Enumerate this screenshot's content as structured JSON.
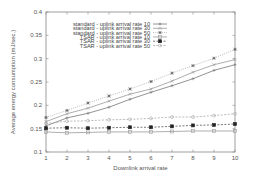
{
  "chart_data": {
    "type": "line",
    "title": "",
    "xlabel": "Downlink arrival rate",
    "ylabel": "Average energy consumption (mJ/sec.)",
    "x": [
      1,
      2,
      3,
      4,
      5,
      6,
      7,
      8,
      9,
      10
    ],
    "xlim": [
      1,
      10
    ],
    "ylim": [
      0.1,
      0.4
    ],
    "xticks": [
      "1",
      "2",
      "3",
      "4",
      "5",
      "6",
      "7",
      "8",
      "9",
      "10"
    ],
    "yticks": [
      "0.1",
      "0.15",
      "0.2",
      "0.25",
      "0.3",
      "0.35",
      "0.4"
    ],
    "grid": false,
    "legend_position": "upper-left-inside",
    "series": [
      {
        "name": "standard - uplink arrival rate 10",
        "marker": "plus",
        "dash": "solid",
        "color": "#777777",
        "values": [
          0.156,
          0.173,
          0.183,
          0.196,
          0.213,
          0.228,
          0.242,
          0.257,
          0.275,
          0.287
        ]
      },
      {
        "name": "standard - uplink arrival rate 30",
        "marker": "cross",
        "dash": "solid",
        "color": "#999999",
        "values": [
          0.165,
          0.182,
          0.194,
          0.209,
          0.224,
          0.235,
          0.252,
          0.271,
          0.287,
          0.298
        ]
      },
      {
        "name": "standard - uplink arrival rate 50",
        "marker": "asterisk",
        "dash": "dotted",
        "color": "#aaaaaa",
        "values": [
          0.174,
          0.189,
          0.205,
          0.22,
          0.235,
          0.251,
          0.269,
          0.285,
          0.301,
          0.32
        ]
      },
      {
        "name": "TSAR - uplink arrival rate 10",
        "marker": "square-open",
        "dash": "solid",
        "color": "#999999",
        "values": [
          0.143,
          0.141,
          0.142,
          0.143,
          0.143,
          0.143,
          0.144,
          0.145,
          0.145,
          0.145
        ]
      },
      {
        "name": "TSAR - uplink arrival rate 30",
        "marker": "square-filled",
        "dash": "dashed",
        "color": "#555555",
        "values": [
          0.151,
          0.152,
          0.151,
          0.152,
          0.153,
          0.153,
          0.155,
          0.157,
          0.158,
          0.16
        ]
      },
      {
        "name": "TSAR - uplink arrival rate 50",
        "marker": "circle-open",
        "dash": "dashed",
        "color": "#aaaaaa",
        "values": [
          0.161,
          0.166,
          0.167,
          0.169,
          0.17,
          0.172,
          0.175,
          0.175,
          0.178,
          0.182
        ]
      }
    ]
  }
}
